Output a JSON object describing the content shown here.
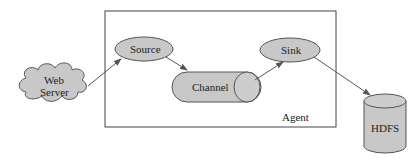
{
  "diagram": {
    "agent_label": "Agent",
    "nodes": {
      "web_server": {
        "line1": "Web",
        "line2": "Server",
        "shape": "cloud"
      },
      "source": {
        "label": "Source",
        "shape": "ellipse"
      },
      "channel": {
        "label": "Channel",
        "shape": "horizontal-cylinder"
      },
      "sink": {
        "label": "Sink",
        "shape": "ellipse"
      },
      "hdfs": {
        "label": "HDFS",
        "shape": "cylinder"
      }
    },
    "edges": [
      {
        "from": "Web Server",
        "to": "Source"
      },
      {
        "from": "Source",
        "to": "Channel"
      },
      {
        "from": "Channel",
        "to": "Sink"
      },
      {
        "from": "Sink",
        "to": "HDFS"
      }
    ],
    "colors": {
      "fill": "#c8c8c8",
      "stroke": "#555555",
      "box": "#444444"
    }
  }
}
